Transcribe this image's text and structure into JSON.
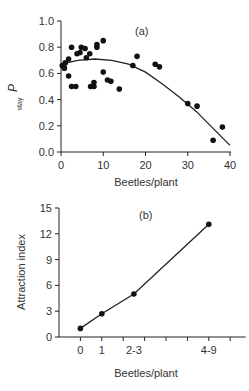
{
  "chart_data": [
    {
      "type": "scatter",
      "panel_label": "(a)",
      "title": "",
      "xlabel": "Beetles/plant",
      "ylabel": "P",
      "ylabel_subscript": "stay",
      "xlim": [
        0,
        40
      ],
      "ylim": [
        0.0,
        1.0
      ],
      "xticks": [
        0,
        10,
        20,
        30,
        40
      ],
      "xtick_labels": [
        "0",
        "10",
        "20",
        "30",
        "40"
      ],
      "yticks": [
        0.0,
        0.2,
        0.4,
        0.6,
        0.8,
        1.0
      ],
      "ytick_labels": [
        "0.0",
        "0.2",
        "0.4",
        "0.6",
        "0.8",
        "1.0"
      ],
      "grid": false,
      "legend": null,
      "points": [
        [
          0.3,
          0.66
        ],
        [
          0.8,
          0.64
        ],
        [
          1.0,
          0.68
        ],
        [
          1.8,
          0.71
        ],
        [
          1.8,
          0.58
        ],
        [
          2.5,
          0.8
        ],
        [
          2.5,
          0.5
        ],
        [
          3.5,
          0.5
        ],
        [
          3.8,
          0.75
        ],
        [
          4.5,
          0.76
        ],
        [
          4.8,
          0.8
        ],
        [
          5.7,
          0.79
        ],
        [
          6.0,
          0.72
        ],
        [
          6.8,
          0.75
        ],
        [
          7.0,
          0.5
        ],
        [
          7.8,
          0.53
        ],
        [
          7.8,
          0.5
        ],
        [
          8.5,
          0.8
        ],
        [
          8.5,
          0.82
        ],
        [
          10.0,
          0.85
        ],
        [
          10.0,
          0.61
        ],
        [
          11.0,
          0.55
        ],
        [
          11.8,
          0.54
        ],
        [
          13.8,
          0.48
        ],
        [
          17.0,
          0.66
        ],
        [
          18.0,
          0.73
        ],
        [
          22.3,
          0.67
        ],
        [
          23.3,
          0.65
        ],
        [
          30.0,
          0.37
        ],
        [
          32.2,
          0.35
        ],
        [
          36.0,
          0.09
        ],
        [
          38.2,
          0.19
        ]
      ],
      "fit_curve": {
        "type": "quadratic",
        "x": [
          0,
          4,
          8,
          12,
          16,
          20,
          24,
          28,
          32,
          36,
          40
        ],
        "y": [
          0.67,
          0.7,
          0.71,
          0.7,
          0.67,
          0.61,
          0.52,
          0.42,
          0.31,
          0.18,
          0.05
        ]
      }
    },
    {
      "type": "line",
      "panel_label": "(b)",
      "title": "",
      "xlabel": "Beetles/plant",
      "ylabel": "Attraction index",
      "categories": [
        "0",
        "1",
        "2-3",
        "4-9"
      ],
      "x_positions": [
        1,
        2,
        3.5,
        7
      ],
      "values": [
        1.0,
        2.7,
        5.0,
        13.1
      ],
      "ylim": [
        0,
        15
      ],
      "yticks": [
        0,
        3,
        6,
        9,
        12,
        15
      ],
      "ytick_labels": [
        "0",
        "3",
        "6",
        "9",
        "12",
        "15"
      ],
      "xtick_count": 9,
      "grid": false,
      "legend": null
    }
  ]
}
